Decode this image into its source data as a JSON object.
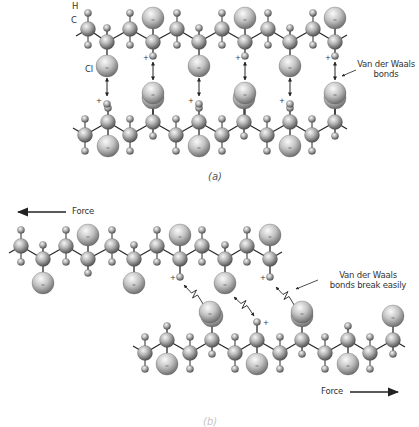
{
  "figure": {
    "colors": {
      "atom_light": "#f4f4f4",
      "atom_mid": "#a8a8a8",
      "atom_dark": "#4a4a4a",
      "bond": "#333333",
      "text": "#333333"
    }
  },
  "panel_a": {
    "label": "(a)",
    "atom_labels": {
      "H": "H",
      "C": "C",
      "Cl": "Cl"
    },
    "callout": {
      "line1": "Van der Waals",
      "line2": "bonds"
    },
    "plus": "+",
    "minus": "−"
  },
  "panel_b": {
    "label": "(b)",
    "force_left": "Force",
    "force_right": "Force",
    "callout": {
      "line1": "Van der Waals",
      "line2": "bonds break easily"
    },
    "plus": "+"
  },
  "atoms": {
    "a_top_chain": {
      "up_y": 29,
      "down_y": 42,
      "carbons": [
        {
          "x": 88,
          "pos": "up"
        },
        {
          "x": 107,
          "pos": "down",
          "sub": "cl_below"
        },
        {
          "x": 130,
          "pos": "up"
        },
        {
          "x": 153,
          "pos": "down",
          "sub": "cl_above_h_below"
        },
        {
          "x": 177,
          "pos": "up"
        },
        {
          "x": 199,
          "pos": "down",
          "sub": "cl_below"
        },
        {
          "x": 222,
          "pos": "up"
        },
        {
          "x": 245,
          "pos": "down",
          "sub": "cl_above_h_below"
        },
        {
          "x": 268,
          "pos": "up"
        },
        {
          "x": 290,
          "pos": "down",
          "sub": "cl_below"
        },
        {
          "x": 313,
          "pos": "up"
        },
        {
          "x": 335,
          "pos": "down",
          "sub": "cl_above_h_below"
        }
      ]
    },
    "a_bottom_chain": {
      "up_y": 122,
      "down_y": 135,
      "carbons": [
        {
          "x": 85,
          "pos": "down"
        },
        {
          "x": 108,
          "pos": "up",
          "sub": "h_above_cl_below"
        },
        {
          "x": 130,
          "pos": "down"
        },
        {
          "x": 153,
          "pos": "up",
          "sub": "cl_above"
        },
        {
          "x": 176,
          "pos": "down"
        },
        {
          "x": 199,
          "pos": "up",
          "sub": "h_above_cl_below"
        },
        {
          "x": 222,
          "pos": "down"
        },
        {
          "x": 244,
          "pos": "up",
          "sub": "cl_above"
        },
        {
          "x": 267,
          "pos": "down"
        },
        {
          "x": 290,
          "pos": "up",
          "sub": "h_above_cl_below"
        },
        {
          "x": 312,
          "pos": "down"
        },
        {
          "x": 335,
          "pos": "up",
          "sub": "cl_above"
        }
      ]
    },
    "b_top_chain": {
      "up_y": 246,
      "down_y": 259,
      "carbons": [
        {
          "x": 21,
          "pos": "up"
        },
        {
          "x": 43,
          "pos": "down",
          "sub": "cl_below"
        },
        {
          "x": 66,
          "pos": "up"
        },
        {
          "x": 88,
          "pos": "down",
          "sub": "cl_above_h_below"
        },
        {
          "x": 112,
          "pos": "up"
        },
        {
          "x": 134,
          "pos": "down",
          "sub": "cl_below"
        },
        {
          "x": 157,
          "pos": "up"
        },
        {
          "x": 180,
          "pos": "down",
          "sub": "cl_above_hplus_below"
        },
        {
          "x": 202,
          "pos": "up"
        },
        {
          "x": 225,
          "pos": "down",
          "sub": "cl_below"
        },
        {
          "x": 247,
          "pos": "up"
        },
        {
          "x": 270,
          "pos": "down",
          "sub": "cl_above_hplus_below"
        }
      ]
    },
    "b_bottom_chain": {
      "up_y": 340,
      "down_y": 353,
      "carbons": [
        {
          "x": 145,
          "pos": "down"
        },
        {
          "x": 167,
          "pos": "up",
          "sub": "h_above_cl_below"
        },
        {
          "x": 190,
          "pos": "down"
        },
        {
          "x": 212,
          "pos": "up",
          "sub": "cl_above"
        },
        {
          "x": 235,
          "pos": "down"
        },
        {
          "x": 257,
          "pos": "up",
          "sub": "hplus_above_cl_below"
        },
        {
          "x": 280,
          "pos": "down"
        },
        {
          "x": 302,
          "pos": "up",
          "sub": "cl_above"
        },
        {
          "x": 325,
          "pos": "down"
        },
        {
          "x": 348,
          "pos": "up",
          "sub": "h_above_cl_below"
        },
        {
          "x": 370,
          "pos": "down"
        },
        {
          "x": 393,
          "pos": "up",
          "sub": "cl_above"
        }
      ]
    }
  }
}
